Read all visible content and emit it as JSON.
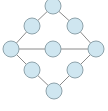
{
  "diagram": {
    "type": "graph",
    "colors": {
      "background": "#ffffff",
      "node_fill": "#cfe6f0",
      "node_stroke": "#8fa3ab",
      "edge": "#8a8a8a"
    },
    "node_radius": 8,
    "nodes": [
      {
        "id": "top",
        "x": 53,
        "y": 6
      },
      {
        "id": "upper-left",
        "x": 32,
        "y": 26
      },
      {
        "id": "upper-right",
        "x": 75,
        "y": 26
      },
      {
        "id": "mid-left",
        "x": 11,
        "y": 49
      },
      {
        "id": "center",
        "x": 53,
        "y": 49
      },
      {
        "id": "mid-right",
        "x": 96,
        "y": 49
      },
      {
        "id": "lower-left",
        "x": 32,
        "y": 70
      },
      {
        "id": "lower-right",
        "x": 75,
        "y": 70
      },
      {
        "id": "bottom",
        "x": 54,
        "y": 91
      }
    ],
    "edges": [
      [
        "top",
        "upper-left"
      ],
      [
        "top",
        "upper-right"
      ],
      [
        "upper-left",
        "mid-left"
      ],
      [
        "upper-right",
        "mid-right"
      ],
      [
        "mid-left",
        "center"
      ],
      [
        "center",
        "mid-right"
      ],
      [
        "mid-left",
        "lower-left"
      ],
      [
        "mid-right",
        "lower-right"
      ],
      [
        "lower-left",
        "bottom"
      ],
      [
        "lower-right",
        "bottom"
      ]
    ]
  }
}
